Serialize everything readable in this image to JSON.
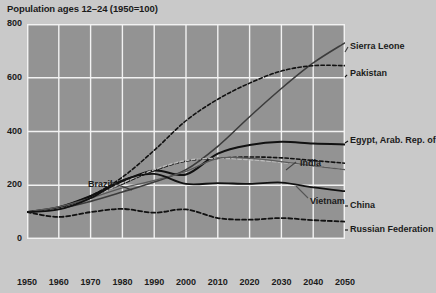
{
  "chart_data": {
    "type": "line",
    "title": "Population ages 12–24 (1950=100)",
    "xlabel": "",
    "ylabel": "",
    "xlim": [
      1950,
      2050
    ],
    "ylim": [
      0,
      800
    ],
    "xticks": [
      "1950",
      "1960",
      "1970",
      "1980",
      "1990",
      "2000",
      "2010",
      "2020",
      "2030",
      "2040",
      "2050"
    ],
    "yticks": [
      "0",
      "200",
      "400",
      "600",
      "800"
    ],
    "grid": true,
    "legend_position": "right-inline",
    "background": "#939393",
    "page_background": "#c9c9c9",
    "x": [
      1950,
      1960,
      1970,
      1980,
      1990,
      2000,
      2010,
      2020,
      2030,
      2040,
      2050
    ],
    "series": [
      {
        "name": "Sierra Leone",
        "style": "solid",
        "color": "#3c3c3c",
        "width": 1.6,
        "label_x": 350,
        "label_y": 47,
        "values": [
          100,
          112,
          140,
          175,
          212,
          258,
          345,
          455,
          560,
          655,
          730
        ]
      },
      {
        "name": "Pakistan",
        "style": "dashed",
        "color": "#111111",
        "width": 1.6,
        "label_x": 350,
        "label_y": 74,
        "values": [
          100,
          115,
          160,
          230,
          330,
          440,
          520,
          580,
          625,
          645,
          645
        ]
      },
      {
        "name": "Egypt, Arab. Rep. of",
        "style": "solid",
        "color": "#111111",
        "width": 2.0,
        "label_x": 350,
        "label_y": 141,
        "values": [
          100,
          118,
          160,
          215,
          255,
          240,
          318,
          350,
          362,
          355,
          352
        ]
      },
      {
        "name": "India",
        "style": "dashed",
        "color": "#111111",
        "width": 1.6,
        "label_x": 300,
        "label_y": 164,
        "values": [
          100,
          118,
          158,
          205,
          255,
          290,
          300,
          305,
          302,
          292,
          282
        ]
      },
      {
        "name": "Vietnam",
        "style": "dashed",
        "color": "#bdbdbd",
        "width": 1.4,
        "label_x": 310,
        "label_y": 202,
        "values": [
          100,
          112,
          152,
          208,
          258,
          292,
          300,
          295,
          285,
          272,
          258
        ]
      },
      {
        "name": "Brazil",
        "style": "solid",
        "color": "#5a5a5a",
        "width": 1.3,
        "label_x": 88,
        "label_y": 185,
        "values": [
          100,
          120,
          152,
          190,
          218,
          252,
          300,
          300,
          288,
          272,
          258
        ]
      },
      {
        "name": "China",
        "style": "solid",
        "color": "#111111",
        "width": 1.8,
        "label_x": 350,
        "label_y": 206,
        "values": [
          100,
          110,
          152,
          218,
          242,
          205,
          208,
          205,
          210,
          192,
          178
        ]
      },
      {
        "name": "Russian Federation",
        "style": "dashed",
        "color": "#111111",
        "width": 1.8,
        "label_x": 350,
        "label_y": 230,
        "values": [
          100,
          82,
          100,
          112,
          98,
          110,
          78,
          72,
          78,
          70,
          65
        ]
      }
    ]
  }
}
